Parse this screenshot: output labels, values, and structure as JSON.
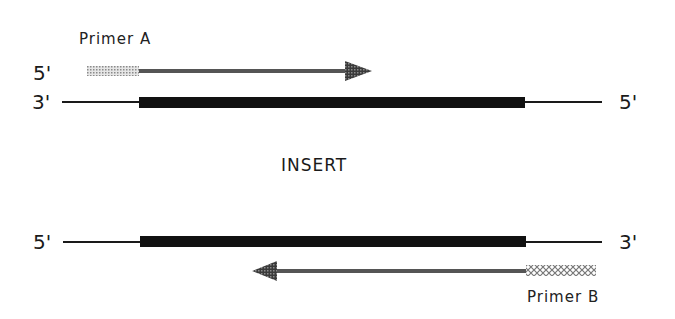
{
  "top_strand": {
    "left_label": "3'",
    "right_label": "5'",
    "primer": {
      "name": "Primer A",
      "end_label": "5'",
      "direction": "right"
    }
  },
  "center_label": "INSERT",
  "bottom_strand": {
    "left_label": "5'",
    "right_label": "3'",
    "primer": {
      "name": "Primer B",
      "direction": "left"
    }
  },
  "colors": {
    "insert_bar": "#111111",
    "strand_line": "#1a1a1a",
    "primer_arrow": "#555555",
    "primer_tail": "#bdbdbd"
  }
}
